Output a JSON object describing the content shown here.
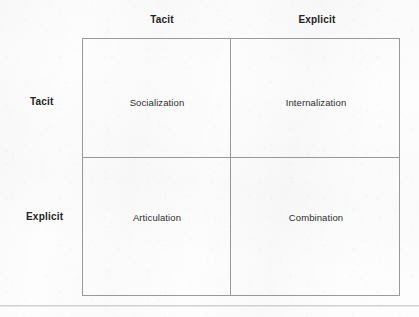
{
  "diagram": {
    "type": "2x2-matrix",
    "column_headers": [
      {
        "label": "Tacit"
      },
      {
        "label": "Explicit"
      }
    ],
    "row_headers": [
      {
        "label": "Tacit"
      },
      {
        "label": "Explicit"
      }
    ],
    "cells": [
      {
        "row": 0,
        "col": 0,
        "label": "Socialization"
      },
      {
        "row": 0,
        "col": 1,
        "label": "Internalization"
      },
      {
        "row": 1,
        "col": 0,
        "label": "Articulation"
      },
      {
        "row": 1,
        "col": 1,
        "label": "Combination"
      }
    ],
    "colors": {
      "background": "#fdfdfd",
      "border": "#9a9a9a",
      "header_text": "#232323",
      "cell_text": "#2e2e2e",
      "bottom_rule": "#c8c8c8"
    }
  }
}
